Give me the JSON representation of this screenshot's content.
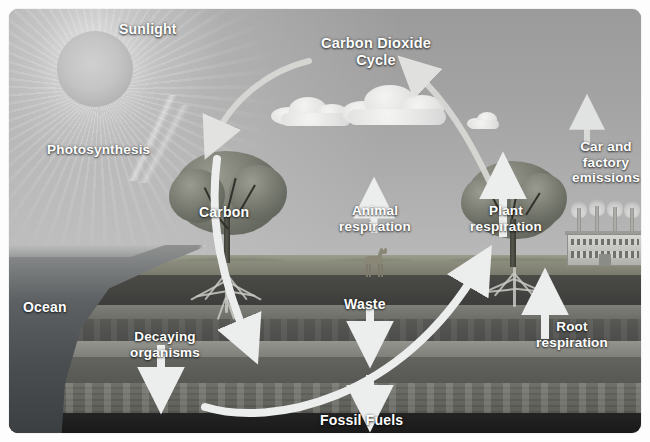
{
  "diagram": {
    "title": "Carbon Dioxide Cycle",
    "labels": {
      "sunlight": "Sunlight",
      "photosynthesis": "Photosynthesis",
      "co2_cycle": "Carbon Dioxide\nCycle",
      "carbon": "Carbon",
      "animal_respiration": "Animal\nrespiration",
      "plant_respiration": "Plant\nrespiration",
      "car_factory_emissions": "Car and\nfactory\nemissions",
      "ocean": "Ocean",
      "waste": "Waste",
      "decaying_organisms": "Decaying\norganisms",
      "root_respiration": "Root\nrespiration",
      "fossil_fuels": "Fossil Fuels"
    },
    "colors": {
      "sky": "#a2a3a2",
      "label_text": "#ffffff",
      "arrow": "#e8e9e6",
      "topsoil": "#7a7b6e",
      "coal": "#1a1a1a",
      "ocean": "#4a4e50",
      "canopy": "#74776c"
    },
    "elements": {
      "sun": "sun-icon",
      "clouds": [
        "cloud-left",
        "cloud-center",
        "cloud-small-right"
      ],
      "trees": [
        "carbon-tree-left",
        "plant-respiration-tree-right"
      ],
      "animal": "deer-icon",
      "factory": "factory-icon",
      "smokestacks": 4
    },
    "strata": [
      "grass",
      "topsoil",
      "soil-dark-upper",
      "light-stripe-1",
      "soil-mid",
      "light-stripe-2",
      "soil-lower",
      "shale-speckled",
      "coal-seam"
    ]
  }
}
